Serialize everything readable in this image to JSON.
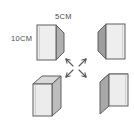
{
  "figure": {
    "background_color": "#ffffff",
    "width_px": 134,
    "height_px": 130
  },
  "labels": {
    "width_label": "5CM",
    "height_label": "10CM",
    "text_color": "#4c4c4c"
  },
  "colors": {
    "outline": "#595959",
    "front_face": "#ececec",
    "side_face": "#b4b4b4",
    "top_face": "#d8d8d8",
    "arrow": "#585858"
  },
  "shapes": [
    {
      "name": "prism-top-left",
      "position": "top-left",
      "front_face": "#eeeeee",
      "side_face": "#b0b0b0",
      "side_on": "right",
      "top_visible": false
    },
    {
      "name": "prism-top-right",
      "position": "top-right",
      "front_face": "#eeeeee",
      "side_face": "#9e9e9e",
      "side_on": "left",
      "top_visible": false
    },
    {
      "name": "prism-bottom-left",
      "position": "bottom-left",
      "front_face": "#ececec",
      "side_face": "#bdbdbd",
      "top_face": "#d9d9d9",
      "side_on": "right",
      "top_visible": true
    },
    {
      "name": "prism-bottom-right",
      "position": "bottom-right",
      "front_face": "#ededed",
      "side_face": "#a8a8a8",
      "top_face": "#d2d2d2",
      "side_on": "left",
      "top_visible": true
    }
  ],
  "arrows": {
    "name": "radiating-arrows",
    "count": 4,
    "directions": [
      "up-left",
      "up-right",
      "down-left",
      "down-right"
    ],
    "color": "#585858"
  }
}
